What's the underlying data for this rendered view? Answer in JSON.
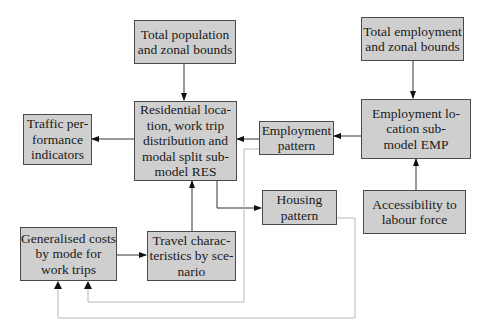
{
  "diagram": {
    "nodes": [
      {
        "id": "total-population",
        "label": "Total population\nand zonal bounds"
      },
      {
        "id": "total-employment",
        "label": "Total employment\nand zonal bounds"
      },
      {
        "id": "residential",
        "label": "Residential loca-\ntion, work trip\ndistribution and\nmodal split sub-\nmodel RES"
      },
      {
        "id": "traffic-performance",
        "label": "Traffic per-\nformance\nindicators"
      },
      {
        "id": "employment-pattern",
        "label": "Employment\npattern"
      },
      {
        "id": "employment-location",
        "label": "Employment lo-\ncation sub-\nmodel EMP"
      },
      {
        "id": "housing-pattern",
        "label": "Housing\npattern"
      },
      {
        "id": "accessibility",
        "label": "Accessibility to\nlabour force"
      },
      {
        "id": "generalised-costs",
        "label": "Generalised costs\nby mode for\nwork trips"
      },
      {
        "id": "travel-characteristics",
        "label": "Travel charac-\nteristics by sce-\nnario"
      }
    ],
    "edges": [
      {
        "from": "total-population",
        "to": "residential"
      },
      {
        "from": "total-employment",
        "to": "employment-location"
      },
      {
        "from": "residential",
        "to": "traffic-performance"
      },
      {
        "from": "employment-pattern",
        "to": "residential"
      },
      {
        "from": "employment-location",
        "to": "employment-pattern"
      },
      {
        "from": "accessibility",
        "to": "employment-location"
      },
      {
        "from": "residential",
        "to": "housing-pattern"
      },
      {
        "from": "generalised-costs",
        "to": "travel-characteristics"
      },
      {
        "from": "travel-characteristics",
        "to": "residential"
      },
      {
        "from": "employment-pattern",
        "to": "generalised-costs",
        "style": "light"
      },
      {
        "from": "housing-pattern",
        "to": "generalised-costs",
        "style": "light"
      }
    ]
  }
}
